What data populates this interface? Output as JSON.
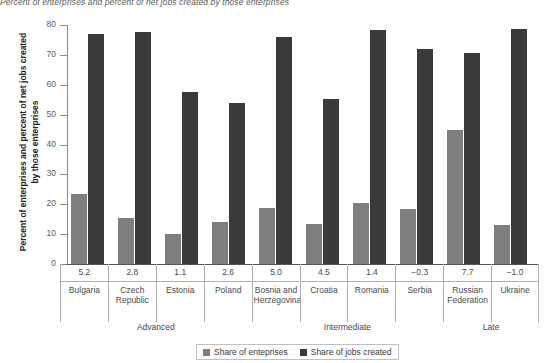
{
  "chart_data": {
    "type": "bar",
    "title": "Percent of enterprises and percent of net jobs created by those enterprises",
    "xlabel": "",
    "ylabel": "Percent of enterprises and percent of net jobs created by those enterprises",
    "ylim": [
      0,
      80
    ],
    "yticks": [
      0,
      10,
      20,
      30,
      40,
      50,
      60,
      70,
      80
    ],
    "grid": false,
    "legend_position": "bottom",
    "categories": [
      "Bulgaria",
      "Czech Republic",
      "Estonia",
      "Poland",
      "Bosnia and Herzegovina",
      "Croatia",
      "Romania",
      "Serbia",
      "Russian Federation",
      "Ukraine"
    ],
    "category_values": [
      "5.2",
      "2.8",
      "1.1",
      "2.6",
      "5.0",
      "4.5",
      "1.4",
      "−0.3",
      "7.7",
      "−1.0"
    ],
    "series": [
      {
        "name": "Share of enteprises",
        "color": "#7e7e7e",
        "values": [
          23.4,
          15.3,
          10.2,
          14.1,
          18.7,
          13.5,
          20.4,
          18.5,
          44.7,
          13.2
        ]
      },
      {
        "name": "Share of jobs created",
        "color": "#3a3a3a",
        "values": [
          77.0,
          77.6,
          57.7,
          53.9,
          76.0,
          55.4,
          78.2,
          72.0,
          70.8,
          78.6
        ]
      }
    ],
    "groups": [
      {
        "label": "Advanced",
        "start": 0,
        "end": 3
      },
      {
        "label": "Intermediate",
        "start": 4,
        "end": 7
      },
      {
        "label": "Late",
        "start": 8,
        "end": 9
      }
    ]
  },
  "legend": {
    "items": [
      {
        "label": "Share of enteprises"
      },
      {
        "label": "Share of jobs created"
      }
    ]
  }
}
